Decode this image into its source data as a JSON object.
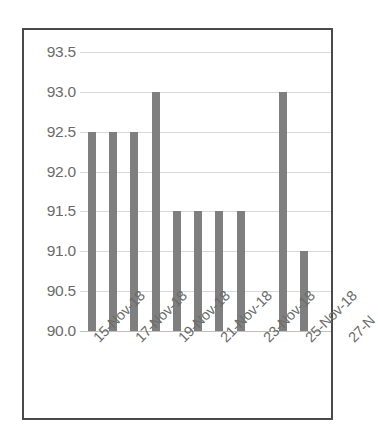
{
  "chart_data": {
    "type": "bar",
    "title": "",
    "subtitle": "",
    "xlabel": "",
    "ylabel": "",
    "categories": [
      "15-Nov-18",
      "16-Nov-18",
      "17-Nov-18",
      "18-Nov-18",
      "19-Nov-18",
      "20-Nov-18",
      "21-Nov-18",
      "22-Nov-18",
      "23-Nov-18",
      "24-Nov-18",
      "25-Nov-18"
    ],
    "values": [
      92.5,
      92.5,
      92.5,
      93.0,
      91.5,
      91.5,
      91.5,
      91.5,
      null,
      93.0,
      91.0
    ],
    "ylim": [
      90.0,
      93.5
    ],
    "ytick_labels": [
      "93.5",
      "93.0",
      "92.5",
      "92.0",
      "91.5",
      "91.0",
      "90.5",
      "90.0"
    ],
    "ytick_values": [
      93.5,
      93.0,
      92.5,
      92.0,
      91.5,
      91.0,
      90.5,
      90.0
    ],
    "xtick_labels": [
      "15-Nov-18",
      "17-Nov-18",
      "19-Nov-18",
      "21-Nov-18",
      "23-Nov-18",
      "25-Nov-18",
      "27-N"
    ],
    "xtick_label_interval": 2,
    "grid": true,
    "legend": false,
    "legend_position": "none",
    "bar_color": "#7f7f7f",
    "gridline_color": "#d9d9d9",
    "axis_label_color": "#6b6b6b",
    "frame_color": "#4a4a4a",
    "background_color": "#ffffff"
  }
}
